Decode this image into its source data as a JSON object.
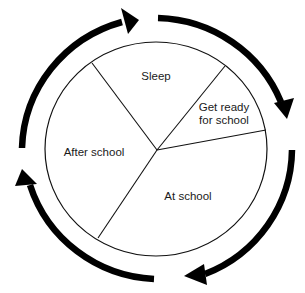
{
  "diagram": {
    "type": "cycle-pie",
    "segments": [
      {
        "label": "Sleep",
        "x": 156,
        "y": 76
      },
      {
        "label_line1": "Get ready",
        "label_line2": "for school",
        "x": 224,
        "y": 114
      },
      {
        "label": "After school",
        "x": 94,
        "y": 152
      },
      {
        "label": "At school",
        "x": 188,
        "y": 196
      }
    ],
    "arrows": [
      {
        "name": "top-left-arrow",
        "direction": "clockwise"
      },
      {
        "name": "top-right-arrow",
        "direction": "clockwise"
      },
      {
        "name": "bottom-right-arrow",
        "direction": "clockwise"
      },
      {
        "name": "bottom-left-arrow",
        "direction": "clockwise"
      }
    ],
    "colors": {
      "line": "#111111",
      "arrow": "#000000",
      "background": "#ffffff"
    }
  }
}
